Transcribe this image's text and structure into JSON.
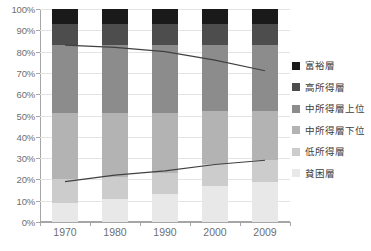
{
  "chart_data": {
    "type": "bar",
    "title": "",
    "subtitle": "",
    "xlabel": "",
    "ylabel": "",
    "stacked": true,
    "stack_mode": "percent",
    "grid": true,
    "legend_position": "right",
    "ylim": [
      0,
      100
    ],
    "ytick_labels": [
      "100%",
      "90%",
      "80%",
      "70%",
      "60%",
      "50%",
      "40%",
      "30%",
      "20%",
      "10%",
      "0%"
    ],
    "ytick_values": [
      100,
      90,
      80,
      70,
      60,
      50,
      40,
      30,
      20,
      10,
      0
    ],
    "categories": [
      "1970",
      "1980",
      "1990",
      "2000",
      "2009"
    ],
    "series": [
      {
        "name": "貧困層",
        "color": "#e8e8e8",
        "values": [
          9,
          11,
          13,
          17,
          19
        ]
      },
      {
        "name": "低所得層",
        "color": "#cccccc",
        "values": [
          11,
          10,
          10,
          10,
          10
        ]
      },
      {
        "name": "中所得層下位",
        "color": "#b3b3b3",
        "values": [
          31,
          30,
          28,
          25,
          23
        ]
      },
      {
        "name": "中所得層上位",
        "color": "#8c8c8c",
        "values": [
          32,
          32,
          32,
          31,
          31
        ]
      },
      {
        "name": "高所得層",
        "color": "#4d4d4d",
        "values": [
          10,
          10,
          10,
          10,
          10
        ]
      },
      {
        "name": "富裕層",
        "color": "#1a1a1a",
        "values": [
          7,
          7,
          7,
          7,
          7
        ]
      }
    ],
    "overlay_lines": [
      {
        "name": "upper-cumulative-line",
        "color": "#404040",
        "values": [
          83,
          82,
          80,
          76,
          71
        ]
      },
      {
        "name": "lower-cumulative-line",
        "color": "#404040",
        "values": [
          19,
          22,
          24,
          27,
          29
        ]
      }
    ],
    "legend_entries": [
      "富裕層",
      "高所得層",
      "中所得層上位",
      "中所得層下位",
      "低所得層",
      "貧困層"
    ],
    "legend_colors": [
      "#1a1a1a",
      "#4d4d4d",
      "#8c8c8c",
      "#b3b3b3",
      "#cccccc",
      "#e8e8e8"
    ]
  },
  "colors": {
    "axis": "#a6a6a6",
    "grid": "#e4e4e4",
    "tick_text": "#6f6f6f",
    "legend_text": "#404040",
    "background": "#ffffff"
  }
}
